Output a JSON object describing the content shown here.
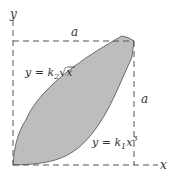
{
  "figure": {
    "type": "area-between-curves",
    "axes": {
      "x_label": "x",
      "y_label": "y"
    },
    "dimensions": {
      "top_label": "a",
      "right_label": "a"
    },
    "curves": [
      {
        "name": "upper",
        "label_prefix": "y = k",
        "label_sub": "2",
        "label_suffix": "√x",
        "equation": "y = k2√x"
      },
      {
        "name": "lower",
        "label_prefix": "y = k",
        "label_sub": "1",
        "label_suffix": "x",
        "label_sup": "3",
        "equation": "y = k1x^3"
      }
    ],
    "colors": {
      "fill": "#bdbdbd",
      "outline": "#6a6a6a",
      "dash": "#555555",
      "text": "#333333"
    }
  }
}
